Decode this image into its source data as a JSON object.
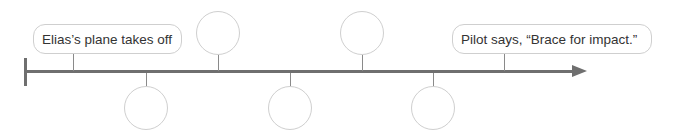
{
  "timeline": {
    "start_label": "Elias’s plane takes off",
    "end_label": "Pilot says, “Brace for impact.”",
    "events": [
      {
        "position": "top",
        "label": ""
      },
      {
        "position": "bottom",
        "label": ""
      },
      {
        "position": "top",
        "label": ""
      },
      {
        "position": "bottom",
        "label": ""
      },
      {
        "position": "top",
        "label": ""
      },
      {
        "position": "bottom",
        "label": ""
      }
    ],
    "colors": {
      "axis": "#6f6f6f",
      "outline": "#cfcfcf",
      "text": "#333333"
    }
  }
}
